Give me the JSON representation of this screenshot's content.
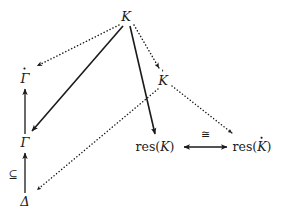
{
  "diagram": {
    "type": "commutative-diagram",
    "background_color": "#ffffff",
    "ink_color": "#1a1a1a",
    "nodes": [
      {
        "id": "K",
        "label": "K",
        "display": "K",
        "accent": "none",
        "x": 126,
        "y": 16,
        "style": "italic"
      },
      {
        "id": "Gamma_dot",
        "label": "Γ̇",
        "display": "Γ",
        "accent": "dot",
        "x": 25,
        "y": 78,
        "style": "italic"
      },
      {
        "id": "K_dot",
        "label": "K̇",
        "display": "K",
        "accent": "dot",
        "x": 163,
        "y": 80,
        "style": "italic"
      },
      {
        "id": "Gamma",
        "label": "Γ",
        "display": "Γ",
        "accent": "none",
        "x": 25,
        "y": 142,
        "style": "italic"
      },
      {
        "id": "res_K",
        "label": "res(K)",
        "display": "res(K)",
        "accent": "none",
        "x": 155,
        "y": 147,
        "style": "upright"
      },
      {
        "id": "res_K_dot",
        "label": "res(K̇)",
        "display": "res(K)",
        "accent": "dot-in-paren",
        "x": 252,
        "y": 147,
        "style": "upright"
      },
      {
        "id": "Delta",
        "label": "Δ",
        "display": "Δ",
        "accent": "none",
        "x": 25,
        "y": 201,
        "style": "italic"
      }
    ],
    "edges": [
      {
        "id": "K-to-Gamma_dot",
        "from": "K",
        "to": "Gamma_dot",
        "line": "dotted",
        "arrow": "end"
      },
      {
        "id": "K-to-K_dot",
        "from": "K",
        "to": "K_dot",
        "line": "dotted",
        "arrow": "end"
      },
      {
        "id": "K-to-Gamma",
        "from": "K",
        "to": "Gamma",
        "line": "solid",
        "arrow": "end"
      },
      {
        "id": "K-to-res_K",
        "from": "K",
        "to": "res_K",
        "line": "solid",
        "arrow": "end"
      },
      {
        "id": "K_dot-to-res_K_dot",
        "from": "K_dot",
        "to": "res_K_dot",
        "line": "dotted",
        "arrow": "end"
      },
      {
        "id": "K_dot-to-Delta",
        "from": "K_dot",
        "to": "Delta",
        "line": "dotted",
        "arrow": "end"
      },
      {
        "id": "Gamma-to-Gamma_dot",
        "from": "Gamma",
        "to": "Gamma_dot",
        "line": "solid",
        "arrow": "end"
      },
      {
        "id": "Delta-to-Gamma",
        "from": "Delta",
        "to": "Gamma",
        "line": "solid",
        "arrow": "end",
        "label": "⊆"
      },
      {
        "id": "res_K-to-res_K_dot",
        "from": "res_K",
        "to": "res_K_dot",
        "line": "solid",
        "arrow": "both",
        "label": "≅"
      }
    ],
    "labels": [
      {
        "id": "subset-label",
        "text": "⊆",
        "x": 13,
        "y": 174
      },
      {
        "id": "iso-label",
        "text": "≅",
        "x": 205,
        "y": 134
      }
    ]
  }
}
